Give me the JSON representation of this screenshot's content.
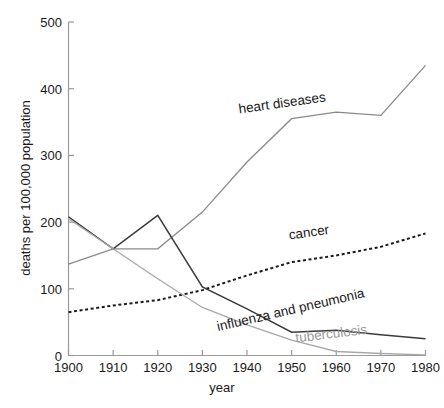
{
  "chart_data": {
    "type": "line",
    "title": "",
    "xlabel": "year",
    "ylabel": "deaths per 100,000 population",
    "x": [
      1900,
      1910,
      1920,
      1930,
      1940,
      1950,
      1960,
      1970,
      1980
    ],
    "xticks": [
      "1900",
      "1910",
      "1920",
      "1930",
      "1940",
      "1950",
      "1960",
      "1970",
      "1980"
    ],
    "yticks": [
      "0",
      "100",
      "200",
      "300",
      "400",
      "500"
    ],
    "xlim": [
      1900,
      1980
    ],
    "ylim": [
      0,
      500
    ],
    "grid": false,
    "legend": "inline-labels",
    "series": [
      {
        "name": "heart diseases",
        "label": "heart diseases",
        "color": "#8a8a8a",
        "style": "solid",
        "width": 1.3,
        "label_x": 1948,
        "label_y": 372,
        "label_rotate": -8,
        "label_anchor": "middle",
        "values": [
          137,
          160,
          160,
          215,
          290,
          355,
          365,
          360,
          435
        ]
      },
      {
        "name": "cancer",
        "label": "cancer",
        "color": "#1a1a1a",
        "style": "dotted",
        "width": 2.0,
        "label_x": 1954,
        "label_y": 178,
        "label_rotate": -8,
        "label_anchor": "middle",
        "values": [
          65,
          75,
          83,
          98,
          120,
          140,
          150,
          163,
          183
        ]
      },
      {
        "name": "influenza and pneumonia",
        "label": "influenza and pneumonia",
        "color": "#3a3a3a",
        "style": "solid",
        "width": 1.5,
        "label_x": 1950,
        "label_y": 62,
        "label_rotate": -13,
        "label_anchor": "middle",
        "values": [
          208,
          160,
          210,
          103,
          70,
          35,
          38,
          31,
          25
        ]
      },
      {
        "name": "tuberculosis",
        "label": "tuberculosis",
        "color": "#a8a8a8",
        "style": "solid",
        "width": 1.3,
        "label_x": 1959,
        "label_y": 26,
        "label_rotate": -7,
        "label_anchor": "middle",
        "values": [
          205,
          160,
          115,
          72,
          46,
          23,
          6,
          3,
          1
        ]
      }
    ]
  },
  "axes": {
    "y_axis_title": "deaths per 100,000 population",
    "x_axis_title": "year"
  }
}
